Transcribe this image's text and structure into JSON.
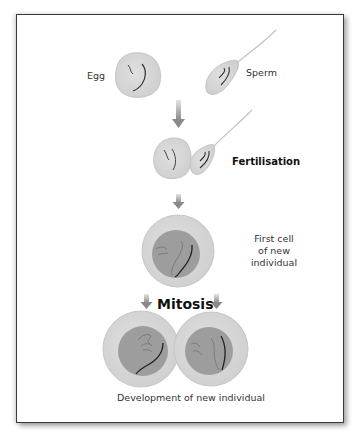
{
  "diagram": {
    "labels": {
      "egg": "Egg",
      "sperm": "Sperm",
      "fertilisation": "Fertilisation",
      "first_cell": [
        "First cell",
        "of new",
        "individual"
      ],
      "mitosis": "Mitosis",
      "development": "Development of new individual"
    },
    "colors": {
      "cell_fill": "#d9d9d9",
      "cell_outline": "#c8c8c8",
      "nucleus_fill": "#9a9a9a",
      "chromosome_dark": "#222222",
      "chromosome_light": "#7a7a7a",
      "arrow": "#8a8a8a",
      "frame_border": "#3a3a3a"
    },
    "stages": [
      {
        "id": "gametes",
        "items": [
          "Egg",
          "Sperm"
        ]
      },
      {
        "id": "fertilisation",
        "items": [
          "Egg + Sperm"
        ]
      },
      {
        "id": "zygote",
        "items": [
          "First cell of new individual"
        ]
      },
      {
        "id": "mitosis",
        "items": [
          "Two daughter cells"
        ]
      }
    ]
  }
}
